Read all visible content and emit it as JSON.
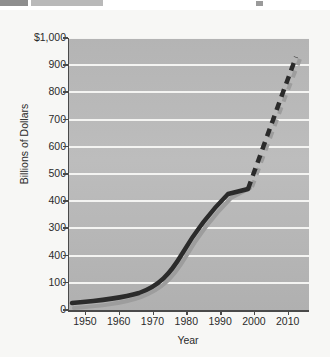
{
  "figure": {
    "y_axis_title": "Billions of Dollars",
    "x_axis_title": "Year"
  },
  "chart_data": {
    "type": "line",
    "title": "",
    "subtitle": "",
    "xlabel": "Year",
    "ylabel": "Billions of Dollars",
    "xlim": [
      1945,
      2016
    ],
    "ylim": [
      0,
      1000
    ],
    "grid": "horizontal white gridlines on grey plot background",
    "legend": "none",
    "y_ticks": [
      0,
      100,
      200,
      300,
      400,
      500,
      600,
      700,
      800,
      900,
      1000
    ],
    "y_tick_labels": [
      "0",
      "100",
      "400",
      "300",
      "400",
      "500",
      "600",
      "700",
      "800",
      "900",
      "$1,000"
    ],
    "y_tick_label_note": "The tick printed between 300 and 100 reads '400' in the scanned source where '200' would be expected.",
    "x_ticks": [
      1950,
      1960,
      1970,
      1980,
      1990,
      2000,
      2010
    ],
    "x_tick_labels": [
      "1950",
      "1960",
      "1970",
      "1980",
      "1990",
      "2000",
      "2010"
    ],
    "series": [
      {
        "name": "historical-actual",
        "style": "solid",
        "color": "#2b2b2b",
        "x": [
          1949,
          1955,
          1960,
          1965,
          1970,
          1975,
          1980,
          1985,
          1990,
          1995,
          2000
        ],
        "values": [
          8,
          12,
          17,
          23,
          32,
          55,
          110,
          190,
          270,
          350,
          450
        ]
      },
      {
        "name": "projection-dark",
        "style": "dashed",
        "color": "#2b2b2b",
        "x": [
          2000,
          2005,
          2010,
          2014
        ],
        "values": [
          450,
          620,
          820,
          1000
        ]
      },
      {
        "name": "projection-light",
        "style": "dashed",
        "color": "#9d9d9d",
        "x": [
          2000,
          2005,
          2010,
          2014
        ],
        "values": [
          410,
          580,
          780,
          960
        ]
      }
    ]
  }
}
